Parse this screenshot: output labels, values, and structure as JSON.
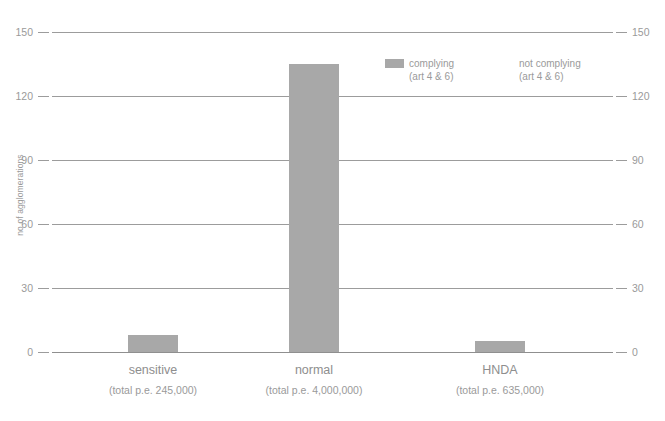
{
  "chart_data": {
    "type": "bar",
    "title": "",
    "subtitle": "",
    "xlabel": "",
    "ylabel": "no of agglomerations",
    "ylim": [
      0,
      150
    ],
    "yticks": [
      0,
      30,
      60,
      90,
      120,
      150
    ],
    "grid": true,
    "dual_y_axis": true,
    "legend_position": "top-right-inside",
    "categories": [
      "sensitive",
      "normal",
      "HNDA"
    ],
    "category_sublabels": [
      "(total p.e. 245,000)",
      "(total p.e. 4,000,000)",
      "(total p.e. 635,000)"
    ],
    "series": [
      {
        "name": "complying",
        "name_line2": "(art 4 & 6)",
        "color": "#a8a8a8",
        "values": [
          8,
          135,
          5
        ]
      },
      {
        "name": "not complying",
        "name_line2": "(art 4 & 6)",
        "color": "#ffffff",
        "values": [
          0,
          0,
          0
        ]
      }
    ]
  },
  "axis": {
    "left_ticks": [
      "150",
      "120",
      "90",
      "60",
      "30",
      "0"
    ],
    "right_ticks": [
      "150",
      "120",
      "90",
      "60",
      "30",
      "0"
    ],
    "y_title": "no of agglomerations"
  },
  "legend": {
    "items": [
      {
        "label": "complying",
        "sublabel": "(art 4 & 6)",
        "swatch": "#a8a8a8",
        "has_swatch": true
      },
      {
        "label": "not complying",
        "sublabel": "(art 4 & 6)",
        "swatch": "#ffffff",
        "has_swatch": false
      }
    ]
  },
  "categories": [
    {
      "name": "sensitive",
      "sublabel": "(total p.e. 245,000)"
    },
    {
      "name": "normal",
      "sublabel": "(total p.e. 4,000,000)"
    },
    {
      "name": "HNDA",
      "sublabel": "(total p.e. 635,000)"
    }
  ],
  "colors": {
    "bar_complying": "#a8a8a8",
    "bar_not_complying": "#ffffff",
    "gridline": "#9c9c9c",
    "text": "#9a9a9a",
    "background": "#ffffff"
  }
}
